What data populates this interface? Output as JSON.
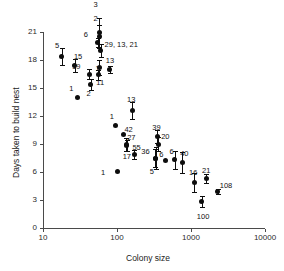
{
  "chart_data": {
    "type": "scatter",
    "title": "",
    "xlabel": "Colony size",
    "ylabel": "Days taken to build nest",
    "xscale": "log",
    "xlim": [
      10,
      10000
    ],
    "ylim": [
      0,
      21
    ],
    "xticks": [
      "10",
      "100",
      "1000",
      "10000"
    ],
    "yticks": [
      "0",
      "3",
      "6",
      "9",
      "12",
      "15",
      "18",
      "21"
    ],
    "grid": false,
    "legend": "none",
    "error_bars": "vertical",
    "points": [
      {
        "label": "5",
        "x": 18,
        "y": 18.4,
        "err": 0.9,
        "lx": -2,
        "ly": -14
      },
      {
        "label": "15",
        "x": 27,
        "y": 17.4,
        "err": 0.7,
        "lx": 4,
        "ly": -13
      },
      {
        "label": "1",
        "x": 29,
        "y": 14.0,
        "err": 0.0,
        "lx": -3,
        "ly": -12
      },
      {
        "label": "19",
        "x": 42,
        "y": 16.5,
        "err": 0.5,
        "lx": -12,
        "ly": -11
      },
      {
        "label": "2",
        "x": 44,
        "y": 15.4,
        "err": 0.6,
        "lx": 1,
        "ly": 6
      },
      {
        "label": "6",
        "x": 55,
        "y": 19.9,
        "err": 0.5,
        "lx": -9,
        "ly": -11
      },
      {
        "label": "2",
        "x": 58,
        "y": 20.5,
        "err": 1.2,
        "lx": -1,
        "ly": -22
      },
      {
        "label": "3",
        "x": 58,
        "y": 20.9,
        "err": 1.6,
        "lx": -1,
        "ly": -32
      },
      {
        "label": "29, 13, 21",
        "x": 60,
        "y": 19.0,
        "err": 0.7,
        "lx": 9,
        "ly": -10
      },
      {
        "label": "1",
        "x": 58,
        "y": 17.2,
        "err": 0.8,
        "lx": 1,
        "ly": -2
      },
      {
        "label": "11",
        "x": 56,
        "y": 16.4,
        "err": 0.5,
        "lx": 3,
        "ly": 4
      },
      {
        "label": "13",
        "x": 80,
        "y": 17.0,
        "err": 0.4,
        "lx": 1,
        "ly": -12
      },
      {
        "label": "1",
        "x": 96,
        "y": 11.0,
        "err": 0.0,
        "lx": -1,
        "ly": -12
      },
      {
        "label": "1",
        "x": 100,
        "y": 6.05,
        "err": 0.0,
        "lx": -11,
        "ly": -3
      },
      {
        "label": "42",
        "x": 122,
        "y": 10.0,
        "err": 0.0,
        "lx": 6,
        "ly": -9
      },
      {
        "label": "27",
        "x": 133,
        "y": 8.9,
        "err": 0.7,
        "lx": 6,
        "ly": -11
      },
      {
        "label": "17",
        "x": 135,
        "y": 8.8,
        "err": 0.6,
        "lx": 1,
        "ly": 7
      },
      {
        "label": "13",
        "x": 160,
        "y": 12.6,
        "err": 0.9,
        "lx": 0,
        "ly": -14
      },
      {
        "label": "55",
        "x": 172,
        "y": 7.9,
        "err": 0.5,
        "lx": 3,
        "ly": -10
      },
      {
        "label": "36",
        "x": 330,
        "y": 7.5,
        "err": 1.0,
        "lx": -9,
        "ly": -10
      },
      {
        "label": "5",
        "x": 335,
        "y": 7.5,
        "err": 1.2,
        "lx": -1,
        "ly": 10
      },
      {
        "label": "39",
        "x": 350,
        "y": 9.8,
        "err": 0.7,
        "lx": 0,
        "ly": -13
      },
      {
        "label": "20",
        "x": 360,
        "y": 9.0,
        "err": 0.7,
        "lx": 8,
        "ly": -11
      },
      {
        "label": "6",
        "x": 450,
        "y": 7.2,
        "err": 0.0,
        "lx": -1,
        "ly": -10
      },
      {
        "label": "6",
        "x": 600,
        "y": 7.3,
        "err": 1.0,
        "lx": 0,
        "ly": -12
      },
      {
        "label": "40",
        "x": 760,
        "y": 7.0,
        "err": 1.1,
        "lx": 3,
        "ly": -13
      },
      {
        "label": "16",
        "x": 1100,
        "y": 4.9,
        "err": 1.0,
        "lx": 0,
        "ly": -13
      },
      {
        "label": "100",
        "x": 1400,
        "y": 2.8,
        "err": 0.6,
        "lx": 0,
        "ly": 11
      },
      {
        "label": "21",
        "x": 1600,
        "y": 5.3,
        "err": 0.5,
        "lx": 1,
        "ly": -12
      },
      {
        "label": "108",
        "x": 2300,
        "y": 3.9,
        "err": 0.3,
        "lx": 7,
        "ly": -10
      }
    ]
  }
}
